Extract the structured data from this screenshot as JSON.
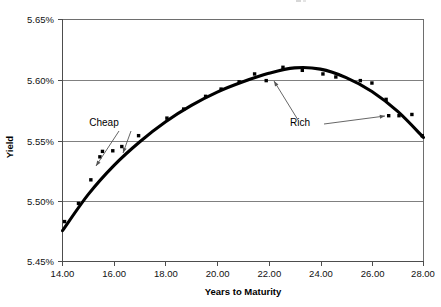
{
  "chart_data": {
    "type": "scatter",
    "title": "",
    "xlabel": "Years to Maturity",
    "ylabel": "Yield",
    "xlim": [
      14.0,
      28.0
    ],
    "ylim": [
      5.45,
      5.65
    ],
    "xticks": [
      "14.00",
      "16.00",
      "18.00",
      "20.00",
      "22.00",
      "24.00",
      "26.00",
      "28.00"
    ],
    "xtick_values": [
      14,
      16,
      18,
      20,
      22,
      24,
      26,
      28
    ],
    "yticks": [
      "5.45%",
      "5.50%",
      "5.55%",
      "5.60%",
      "5.65%"
    ],
    "ytick_values": [
      5.45,
      5.5,
      5.55,
      5.6,
      5.65
    ],
    "grid": "horizontal",
    "legend": "none",
    "series": [
      {
        "name": "Observed bond yields",
        "marker": "square-dot",
        "color": "#000000",
        "points": [
          [
            14.08,
            5.483
          ],
          [
            14.62,
            5.498
          ],
          [
            15.1,
            5.5175
          ],
          [
            15.45,
            5.5365
          ],
          [
            15.55,
            5.541
          ],
          [
            15.95,
            5.5415
          ],
          [
            16.3,
            5.545
          ],
          [
            16.95,
            5.554
          ],
          [
            18.05,
            5.5685
          ],
          [
            18.7,
            5.576
          ],
          [
            19.55,
            5.5865
          ],
          [
            20.15,
            5.5925
          ],
          [
            20.85,
            5.5985
          ],
          [
            21.45,
            5.605
          ],
          [
            21.9,
            5.5995
          ],
          [
            22.55,
            5.6105
          ],
          [
            23.3,
            5.608
          ],
          [
            24.1,
            5.605
          ],
          [
            24.6,
            5.6025
          ],
          [
            25.55,
            5.5995
          ],
          [
            26.0,
            5.5975
          ],
          [
            26.55,
            5.584
          ],
          [
            26.65,
            5.5705
          ],
          [
            27.05,
            5.5705
          ],
          [
            27.55,
            5.5715
          ],
          [
            27.95,
            5.554
          ]
        ]
      },
      {
        "name": "Fitted yield curve",
        "type": "line",
        "color": "#000000",
        "points": [
          [
            14.0,
            5.4755
          ],
          [
            15.0,
            5.5055
          ],
          [
            16.0,
            5.5295
          ],
          [
            17.0,
            5.549
          ],
          [
            18.0,
            5.5655
          ],
          [
            19.0,
            5.579
          ],
          [
            20.0,
            5.59
          ],
          [
            21.0,
            5.5985
          ],
          [
            22.0,
            5.6055
          ],
          [
            23.0,
            5.61
          ],
          [
            24.0,
            5.609
          ],
          [
            25.0,
            5.602
          ],
          [
            26.0,
            5.5905
          ],
          [
            27.0,
            5.574
          ],
          [
            28.0,
            5.5525
          ]
        ]
      }
    ],
    "annotations": [
      {
        "text": "Cheap",
        "label_x": 104,
        "label_y": 126,
        "arrows": [
          {
            "from": [
              119,
              131
            ],
            "to": [
              96,
              166
            ]
          },
          {
            "from": [
              131,
              131
            ],
            "to": [
              123,
              153
            ]
          }
        ]
      },
      {
        "text": "Rich",
        "label_x": 300,
        "label_y": 126,
        "arrows": [
          {
            "from": [
              298,
              120
            ],
            "to": [
              274,
              81
            ]
          },
          {
            "from": [
              324,
              124
            ],
            "to": [
              385,
              116
            ]
          }
        ]
      }
    ]
  }
}
